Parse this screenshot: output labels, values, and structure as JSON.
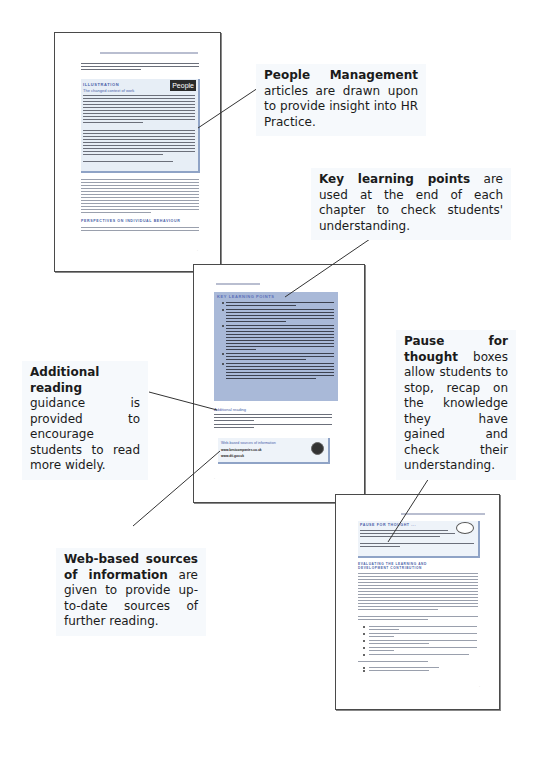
{
  "pages": {
    "illustration_page": {
      "box_heading": "ILLUSTRATION",
      "box_subheading": "The changed context of work",
      "logo_label": "People",
      "section_heading": "PERSPECTIVES ON INDIVIDUAL BEHAVIOUR"
    },
    "key_points_page": {
      "box_heading": "KEY LEARNING POINTS",
      "additional_reading_heading": "Additional reading",
      "web_box_heading": "Web-based sources of information",
      "web_urls": [
        "www.bestcompanies.co.uk",
        "www.dti.gov.uk"
      ]
    },
    "pause_page": {
      "box_heading": "PAUSE FOR THOUGHT ...",
      "section_heading": "EVALUATING THE LEARNING AND DEVELOPMENT CONTRIBUTION"
    }
  },
  "callouts": {
    "people_management": {
      "bold": "People Management",
      "text": " articles are drawn upon to provide insight into HR Practice."
    },
    "key_learning_points": {
      "bold": "Key learning points",
      "text": " are used at the end of each chapter to check students' understanding."
    },
    "additional_reading": {
      "bold": "Additional reading",
      "text": " guidance is provided to encourage students to read more widely."
    },
    "pause_for_thought": {
      "bold": "Pause for thought",
      "text": " boxes allow students to stop, recap on the knowledge they have gained and check their understanding."
    },
    "web_sources": {
      "bold": "Web-based sources of information",
      "text": " are given to provide up-to-date sources of further reading."
    }
  },
  "colors": {
    "illustration_box": "#e7eef6",
    "key_points_box": "#a9b9d8",
    "heading_blue": "#4a5fa8",
    "callout_bg": "#f6f9fc",
    "page_border": "#4a4a4a"
  }
}
